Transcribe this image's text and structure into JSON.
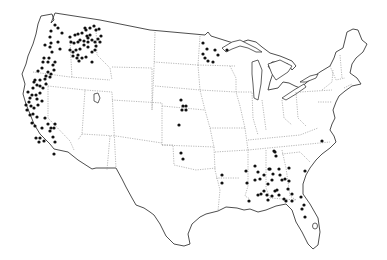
{
  "map": {
    "type": "dot-distribution",
    "region": "Contiguous United States",
    "colors": {
      "background": "#ffffff",
      "outline": "#3a3a3a",
      "state_border": "#8a8a8a",
      "dot": "#111111"
    },
    "dot_radius": 1.6,
    "dots": [
      [
        51,
        31
      ],
      [
        55,
        25
      ],
      [
        58,
        28
      ],
      [
        62,
        33
      ],
      [
        50,
        37
      ],
      [
        51,
        43
      ],
      [
        45,
        45
      ],
      [
        50,
        47
      ],
      [
        58,
        42
      ],
      [
        60,
        49
      ],
      [
        52,
        52
      ],
      [
        49,
        58
      ],
      [
        44,
        58
      ],
      [
        43,
        62
      ],
      [
        48,
        62
      ],
      [
        42,
        68
      ],
      [
        53,
        65
      ],
      [
        55,
        62
      ],
      [
        54,
        70
      ],
      [
        51,
        74
      ],
      [
        46,
        76
      ],
      [
        38,
        71
      ],
      [
        35,
        80
      ],
      [
        40,
        80
      ],
      [
        45,
        79
      ],
      [
        50,
        77
      ],
      [
        48,
        72
      ],
      [
        70,
        37
      ],
      [
        75,
        35
      ],
      [
        78,
        34
      ],
      [
        82,
        33
      ],
      [
        86,
        30
      ],
      [
        87,
        36
      ],
      [
        90,
        28
      ],
      [
        94,
        26
      ],
      [
        96,
        30
      ],
      [
        99,
        29
      ],
      [
        101,
        36
      ],
      [
        98,
        39
      ],
      [
        95,
        42
      ],
      [
        92,
        40
      ],
      [
        88,
        42
      ],
      [
        84,
        41
      ],
      [
        80,
        40
      ],
      [
        78,
        42
      ],
      [
        74,
        43
      ],
      [
        71,
        42
      ],
      [
        70,
        50
      ],
      [
        73,
        52
      ],
      [
        76,
        50
      ],
      [
        80,
        49
      ],
      [
        78,
        55
      ],
      [
        82,
        58
      ],
      [
        86,
        57
      ],
      [
        92,
        52
      ],
      [
        95,
        50
      ],
      [
        92,
        62
      ],
      [
        79,
        61
      ],
      [
        77,
        58
      ],
      [
        73,
        56
      ],
      [
        84,
        45
      ],
      [
        88,
        47
      ],
      [
        90,
        35
      ],
      [
        100,
        42
      ],
      [
        96,
        46
      ],
      [
        85,
        28
      ],
      [
        88,
        38
      ],
      [
        34,
        82
      ],
      [
        37,
        85
      ],
      [
        33,
        88
      ],
      [
        40,
        86
      ],
      [
        43,
        88
      ],
      [
        46,
        84
      ],
      [
        28,
        92
      ],
      [
        32,
        95
      ],
      [
        36,
        95
      ],
      [
        40,
        93
      ],
      [
        30,
        98
      ],
      [
        37,
        99
      ],
      [
        42,
        101
      ],
      [
        29,
        102
      ],
      [
        26,
        105
      ],
      [
        31,
        106
      ],
      [
        34,
        108
      ],
      [
        38,
        105
      ],
      [
        27,
        110
      ],
      [
        30,
        115
      ],
      [
        33,
        114
      ],
      [
        37,
        117
      ],
      [
        45,
        118
      ],
      [
        48,
        124
      ],
      [
        51,
        128
      ],
      [
        54,
        128
      ],
      [
        55,
        124
      ],
      [
        50,
        131
      ],
      [
        32,
        123
      ],
      [
        35,
        126
      ],
      [
        42,
        128
      ],
      [
        36,
        138
      ],
      [
        40,
        138
      ],
      [
        44,
        141
      ],
      [
        39,
        142
      ],
      [
        53,
        137
      ],
      [
        55,
        142
      ],
      [
        54,
        154
      ],
      [
        203,
        43
      ],
      [
        207,
        49
      ],
      [
        203,
        54
      ],
      [
        205,
        58
      ],
      [
        208,
        61
      ],
      [
        215,
        50
      ],
      [
        218,
        55
      ],
      [
        213,
        62
      ],
      [
        227,
        50
      ],
      [
        181,
        100
      ],
      [
        183,
        106
      ],
      [
        186,
        106
      ],
      [
        182,
        110
      ],
      [
        186,
        110
      ],
      [
        179,
        125
      ],
      [
        181,
        153
      ],
      [
        183,
        159
      ],
      [
        222,
        175
      ],
      [
        222,
        183
      ],
      [
        246,
        171
      ],
      [
        247,
        183
      ],
      [
        274,
        151
      ],
      [
        270,
        169
      ],
      [
        273,
        174
      ],
      [
        272,
        180
      ],
      [
        268,
        184
      ],
      [
        249,
        201
      ],
      [
        255,
        166
      ],
      [
        255,
        180
      ],
      [
        258,
        172
      ],
      [
        260,
        179
      ],
      [
        264,
        175
      ],
      [
        269,
        169
      ],
      [
        258,
        195
      ],
      [
        261,
        194
      ],
      [
        264,
        191
      ],
      [
        267,
        195
      ],
      [
        272,
        196
      ],
      [
        275,
        191
      ],
      [
        277,
        190
      ],
      [
        279,
        195
      ],
      [
        268,
        200
      ],
      [
        279,
        169
      ],
      [
        280,
        175
      ],
      [
        282,
        180
      ],
      [
        289,
        168
      ],
      [
        285,
        179
      ],
      [
        289,
        181
      ],
      [
        288,
        189
      ],
      [
        292,
        194
      ],
      [
        284,
        199
      ],
      [
        286,
        201
      ],
      [
        292,
        201
      ],
      [
        305,
        171
      ],
      [
        301,
        197
      ],
      [
        304,
        205
      ],
      [
        302,
        209
      ],
      [
        305,
        217
      ],
      [
        322,
        141
      ],
      [
        275,
        152
      ],
      [
        276,
        156
      ]
    ]
  }
}
